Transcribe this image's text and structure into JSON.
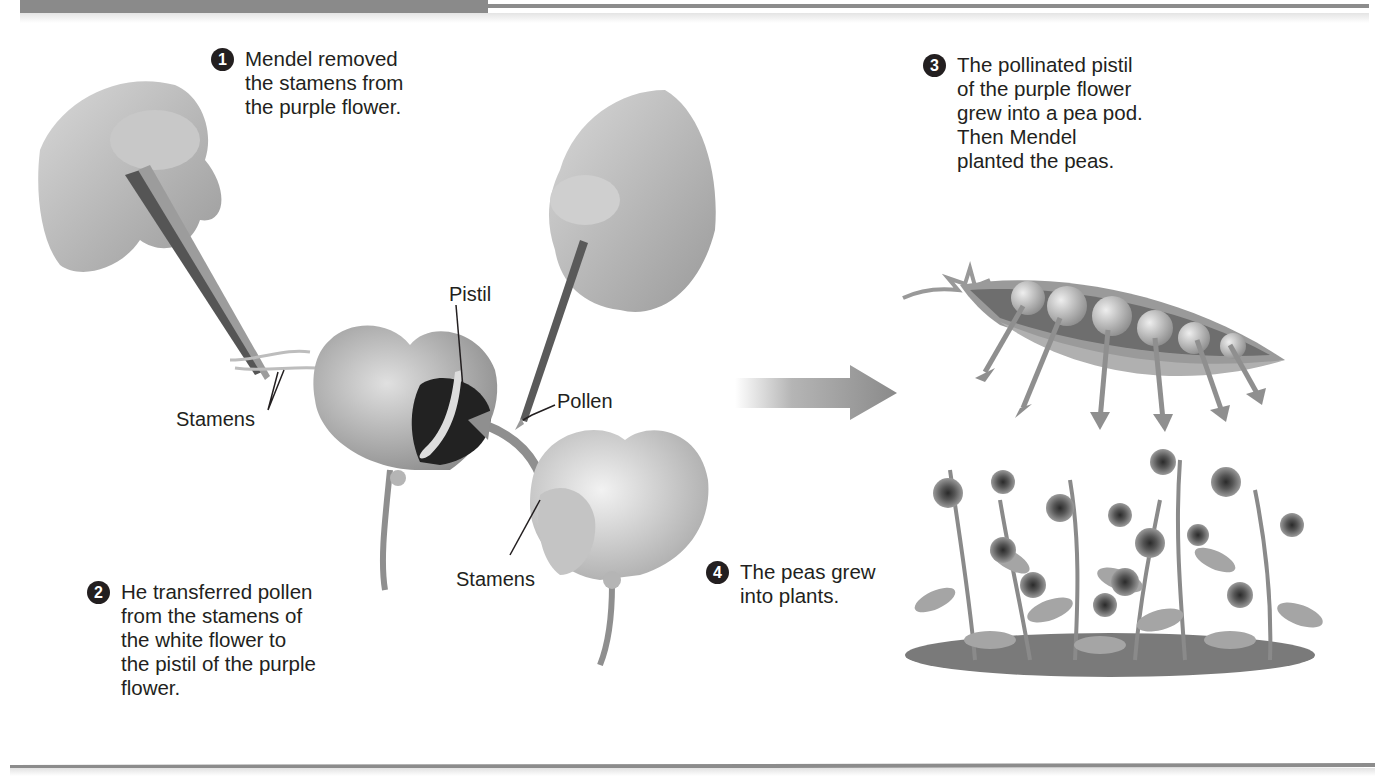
{
  "steps": [
    {
      "number": "1",
      "lines": [
        "Mendel removed",
        "the stamens from",
        "the purple flower."
      ]
    },
    {
      "number": "2",
      "lines": [
        "He transferred pollen",
        "from the stamens of",
        "the white flower to",
        "the pistil of the purple",
        "flower."
      ]
    },
    {
      "number": "3",
      "lines": [
        "The pollinated pistil",
        "of the purple flower",
        "grew into a pea pod.",
        "Then Mendel",
        "planted the peas."
      ]
    },
    {
      "number": "4",
      "lines": [
        "The peas grew",
        "into plants."
      ]
    }
  ],
  "labels": {
    "stamens_left": "Stamens",
    "pistil": "Pistil",
    "pollen": "Pollen",
    "stamens_right": "Stamens"
  },
  "illustrations": {
    "hand_tweezers": "hand-with-tweezers-icon",
    "hand_brush": "hand-with-paintbrush-icon",
    "purple_flower": "purple-pea-flower-icon",
    "white_flower": "white-pea-flower-icon",
    "transfer_arrow": "curved-arrow-icon",
    "process_arrow": "right-arrow-icon",
    "pea_pod": "pea-pod-icon",
    "pea_plants": "pea-plants-icon"
  },
  "colors": {
    "text": "#231f20",
    "rule": "#8c8c8c",
    "arrow": "#8f8f8f"
  }
}
